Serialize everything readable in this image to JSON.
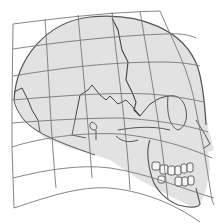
{
  "figure": {
    "colors": {
      "background": "#ffffff",
      "skull_fill": "#e2e2e2",
      "line": "#555555",
      "grid": "#777777"
    }
  }
}
